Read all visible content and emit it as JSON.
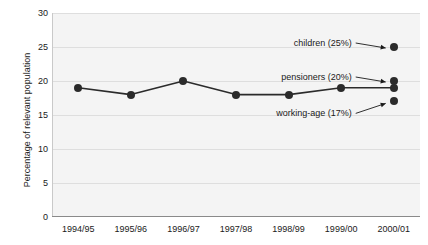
{
  "clipped_title": "2001",
  "chart_data": {
    "type": "line",
    "title": "",
    "xlabel": "",
    "ylabel": "Percentage of relevant population",
    "categories": [
      "1994/95",
      "1995/96",
      "1996/97",
      "1997/98",
      "1998/99",
      "1999/00",
      "2000/01"
    ],
    "yticks": [
      0,
      5,
      10,
      15,
      20,
      25,
      30
    ],
    "ylim": [
      0,
      30
    ],
    "grid": true,
    "legend": "none",
    "series": [
      {
        "name": "working-age",
        "values": [
          19,
          18,
          20,
          18,
          18,
          19,
          19
        ]
      }
    ],
    "endpoint_markers": [
      {
        "label": "children (25%)",
        "category": "2000/01",
        "value": 25
      },
      {
        "label": "pensioners (20%)",
        "category": "2000/01",
        "value": 20
      },
      {
        "label": "working-age (17%)",
        "category": "2000/01",
        "value": 17
      }
    ],
    "annotations": [
      {
        "text": "children (25%)",
        "target_value": 25
      },
      {
        "text": "pensioners (20%)",
        "target_value": 20
      },
      {
        "text": "working-age (17%)",
        "target_value": 17
      }
    ],
    "colors": {
      "marker": "#2b2b2b",
      "line": "#2b2b2b",
      "plot_background": "#f4f4f4",
      "gridline": "#dedede",
      "text": "#1a1a1a"
    }
  }
}
